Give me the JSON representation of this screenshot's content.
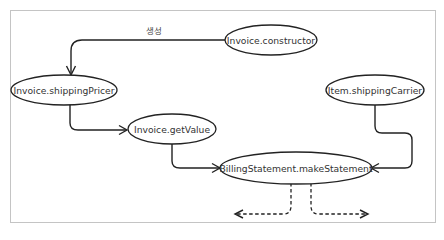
{
  "diagram": {
    "title": "",
    "nodes": [
      {
        "id": "invoice-constructor",
        "label": "Invoice.constructor"
      },
      {
        "id": "invoice-shipping-pricer",
        "label": "Invoice.shippingPricer"
      },
      {
        "id": "item-shipping-carrier",
        "label": "Item.shippingCarrier"
      },
      {
        "id": "invoice-get-value",
        "label": "Invoice.getValue"
      },
      {
        "id": "billing-statement-make-statement",
        "label": "BillingStatement.makeStatement"
      }
    ],
    "edges": [
      {
        "from": "invoice-constructor",
        "to": "invoice-shipping-pricer",
        "label": "생성",
        "style": "solid"
      },
      {
        "from": "invoice-shipping-pricer",
        "to": "invoice-get-value",
        "label": "",
        "style": "solid"
      },
      {
        "from": "invoice-get-value",
        "to": "billing-statement-make-statement",
        "label": "",
        "style": "solid"
      },
      {
        "from": "item-shipping-carrier",
        "to": "billing-statement-make-statement",
        "label": "",
        "style": "solid"
      },
      {
        "from": "billing-statement-make-statement",
        "to": "left-outflow",
        "label": "",
        "style": "dashed"
      },
      {
        "from": "billing-statement-make-statement",
        "to": "right-outflow",
        "label": "",
        "style": "dashed"
      }
    ],
    "colors": {
      "stroke": "#222222",
      "text": "#333333",
      "frame": "#c4c4c4",
      "background": "#ffffff"
    }
  }
}
